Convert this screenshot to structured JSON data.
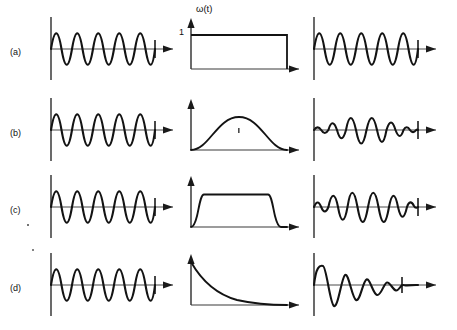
{
  "figure": {
    "width": 457,
    "height": 330,
    "background_color": "#ffffff",
    "stroke_color": "#1a1a1a",
    "axis_color": "#3a3a3a"
  },
  "annotations": {
    "window_axis_label": "ω(t)",
    "window_unit_tick": "1"
  },
  "rows": [
    {
      "id": "a",
      "label": "(a)",
      "signal": {
        "name": "input-sine-wave",
        "type": "sine",
        "cycles": 4,
        "amplitude": 1.0,
        "envelope": "constant"
      },
      "window": {
        "name": "rectangular-window",
        "type": "rectangular",
        "peak": 1,
        "description": "Rectangular (boxcar) window, value 1 over full span"
      },
      "output": {
        "name": "windowed-output",
        "type": "sine",
        "cycles": 4,
        "amplitude": 1.0,
        "envelope": "constant",
        "description": "Unchanged sine wave, abrupt truncation at ends"
      }
    },
    {
      "id": "b",
      "label": "(b)",
      "signal": {
        "name": "input-sine-wave",
        "type": "sine",
        "cycles": 4,
        "amplitude": 1.0,
        "envelope": "constant"
      },
      "window": {
        "name": "hann-window",
        "type": "bell",
        "peak": 1,
        "description": "Smooth cosine bell (Hann) window, zero at both ends"
      },
      "output": {
        "name": "windowed-output",
        "type": "sine",
        "cycles": 4,
        "amplitude": 1.0,
        "envelope": "bell",
        "description": "Sine tapered by the bell window, vanishing at both ends"
      }
    },
    {
      "id": "c",
      "label": "(c)",
      "signal": {
        "name": "input-sine-wave",
        "type": "sine",
        "cycles": 4,
        "amplitude": 1.0,
        "envelope": "constant"
      },
      "window": {
        "name": "tukey-window",
        "type": "flat-top-tapered",
        "peak": 1,
        "description": "Flat-top window with smooth cosine tapers at both ends"
      },
      "output": {
        "name": "windowed-output",
        "type": "sine",
        "cycles": 4,
        "amplitude": 1.0,
        "envelope": "flat-top-tapered",
        "description": "Sine with amplitude flat in the middle, tapered at the ends"
      }
    },
    {
      "id": "d",
      "label": "(d)",
      "signal": {
        "name": "input-sine-wave",
        "type": "sine",
        "cycles": 4,
        "amplitude": 1.0,
        "envelope": "constant"
      },
      "window": {
        "name": "exponential-window",
        "type": "exponential-decay",
        "peak": 1,
        "description": "Exponentially decaying window starting at 1"
      },
      "output": {
        "name": "windowed-output",
        "type": "sine",
        "cycles": 4,
        "amplitude": 1.0,
        "envelope": "exponential-decay",
        "description": "Exponentially damped sine wave"
      }
    }
  ]
}
